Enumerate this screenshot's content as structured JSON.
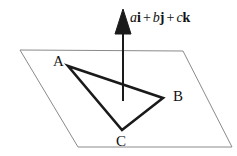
{
  "figure": {
    "type": "geometry-diagram",
    "background_color": "#ffffff",
    "width": 237,
    "height": 156
  },
  "plane": {
    "name": "plane-parallelogram",
    "stroke_color": "#8a8a8a",
    "stroke_width": 1,
    "fill": "none",
    "points": "20,50 183,51 232,147 78,147"
  },
  "triangle": {
    "name": "triangle-ABC",
    "stroke_color": "#1a1a1a",
    "stroke_width": 2.6,
    "fill": "none",
    "points": "68,66 163,98 122,130",
    "vertices": [
      {
        "id": "A",
        "label": "A",
        "x": 68,
        "y": 66
      },
      {
        "id": "B",
        "label": "B",
        "x": 163,
        "y": 98
      },
      {
        "id": "C",
        "label": "C",
        "x": 122,
        "y": 130
      }
    ]
  },
  "normal_vector": {
    "name": "normal-vector-arrow",
    "stroke_color": "#1a1a1a",
    "stroke_width": 2,
    "shaft_x": 123,
    "shaft_top_y": 18,
    "shaft_bottom_y": 101,
    "arrowhead_points": "123,9 131,34 115,34",
    "label": {
      "scalar_a": "a",
      "unit_i": "i",
      "plus_1": "+",
      "scalar_b": "b",
      "unit_j": "j",
      "plus_2": "+",
      "scalar_c": "c",
      "unit_k": "k"
    }
  }
}
